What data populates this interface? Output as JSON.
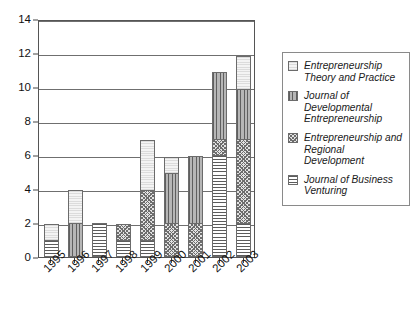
{
  "chart_data": {
    "type": "bar",
    "stacked": true,
    "title": "",
    "subtitle": "",
    "xlabel": "",
    "ylabel": "",
    "categories": [
      "1995",
      "1996",
      "1997",
      "1998",
      "1999",
      "2000",
      "2001",
      "2002",
      "2003"
    ],
    "ylim": [
      0,
      14
    ],
    "ytick_labels": [
      "0",
      "2",
      "4",
      "6",
      "8",
      "10",
      "12",
      "14"
    ],
    "ytick_values": [
      0,
      2,
      4,
      6,
      8,
      10,
      12,
      14
    ],
    "grid": "horizontal",
    "legend_position": "right",
    "series": [
      {
        "name": "Journal of Business Venturing",
        "pattern": "horizontal-hatch",
        "color": "#ffffff",
        "values": [
          1,
          0,
          2,
          1,
          1,
          0,
          0,
          6,
          2
        ]
      },
      {
        "name": "Entrepreneurship and Regional Development",
        "pattern": "cross-hatch",
        "color": "#e3e3e3",
        "values": [
          0,
          0,
          0,
          1,
          3,
          2,
          2,
          1,
          5
        ]
      },
      {
        "name": "Journal of Developmental Entrepreneurship",
        "pattern": "vertical-hatch",
        "color": "#b6b6b6",
        "values": [
          0,
          2,
          0,
          0,
          0,
          3,
          4,
          4,
          3
        ]
      },
      {
        "name": "Entrepreneurship Theory and Practice",
        "pattern": "light-solid",
        "color": "#eeeeee",
        "values": [
          1,
          2,
          0,
          0,
          3,
          1,
          0,
          0,
          2
        ]
      }
    ],
    "totals": [
      2,
      4,
      2,
      2,
      7,
      6,
      6,
      11,
      12
    ]
  },
  "legend": {
    "entries": [
      {
        "label": "Entrepreneurship Theory and Practice",
        "pattern": "light-solid"
      },
      {
        "label": "Journal of Developmental Entrepreneurship",
        "pattern": "vertical-hatch"
      },
      {
        "label": "Entrepreneurship and Regional Development",
        "pattern": "cross-hatch"
      },
      {
        "label": "Journal of Business Venturing",
        "pattern": "horizontal-hatch"
      }
    ]
  }
}
